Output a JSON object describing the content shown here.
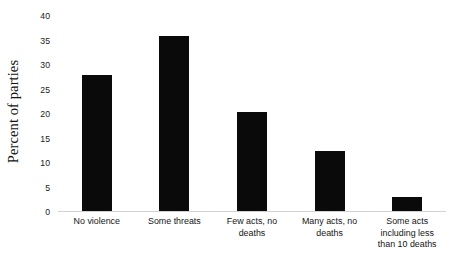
{
  "chart_data": {
    "type": "bar",
    "title": "",
    "subtitle": "",
    "xlabel": "",
    "ylabel": "Percent of parties",
    "categories": [
      "No violence",
      "Some threats",
      "Few acts, no deaths",
      "Many acts, no deaths",
      "Some acts including less than 10 deaths"
    ],
    "category_lines": [
      [
        "No violence"
      ],
      [
        "Some threats"
      ],
      [
        "Few acts, no",
        "deaths"
      ],
      [
        "Many acts, no",
        "deaths"
      ],
      [
        "Some acts",
        "including less",
        "than 10 deaths"
      ]
    ],
    "values": [
      28,
      36,
      20.4,
      12.5,
      3
    ],
    "ylim": [
      0,
      40
    ],
    "ytick_values": [
      40,
      35,
      30,
      25,
      20,
      15,
      10,
      5,
      0
    ],
    "ytick_labels": [
      "40",
      "35",
      "30",
      "25",
      "20",
      "15",
      "10",
      "5",
      "0"
    ],
    "grid": false,
    "legend": false,
    "legend_position": "none",
    "bar_color": "#0a0a0a",
    "axis_color": "#d2d2d2",
    "background_color": "#ffffff"
  }
}
